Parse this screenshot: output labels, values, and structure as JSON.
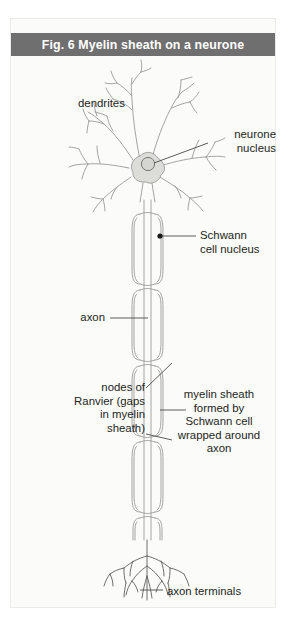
{
  "figure": {
    "title": "Fig. 6  Myelin sheath on a neurone",
    "title_bar_color": "#6f6f6f",
    "title_text_color": "#ffffff",
    "panel_background": "#fbfbfa"
  },
  "labels": {
    "dendrites": "dendrites",
    "neurone_nucleus": "neurone\nnucleus",
    "schwann_cell_nucleus": "Schwann\ncell nucleus",
    "axon": "axon",
    "nodes_of_ranvier": "nodes of\nRanvier (gaps\nin myelin\nsheath)",
    "myelin_sheath": "myelin sheath\nformed by\nSchwann cell\nwrapped around\naxon",
    "axon_terminals": "axon terminals"
  },
  "diagram_colors": {
    "outline": "#9a9a98",
    "soma_fill": "#dcdcd8",
    "leader_line": "#595959",
    "marker_dot": "#1a1a1a"
  }
}
